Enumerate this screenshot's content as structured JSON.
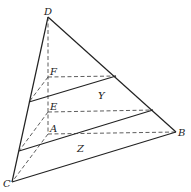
{
  "diagram": {
    "type": "geometric-figure",
    "points": {
      "D": {
        "label": "D",
        "x": 48,
        "y": 17
      },
      "F": {
        "label": "F",
        "x": 48,
        "y": 77
      },
      "E": {
        "label": "E",
        "x": 48,
        "y": 112
      },
      "A": {
        "label": "A",
        "x": 48,
        "y": 134
      },
      "B": {
        "label": "B",
        "x": 176,
        "y": 132
      },
      "C": {
        "label": "C",
        "x": 12,
        "y": 182
      }
    },
    "region_labels": {
      "Y": {
        "label": "Y",
        "x": 100,
        "y": 97
      },
      "Z": {
        "label": "Z",
        "x": 79,
        "y": 149
      }
    }
  }
}
